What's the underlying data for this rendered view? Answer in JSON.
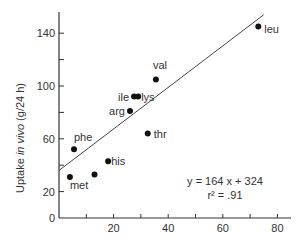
{
  "chart_data": {
    "type": "scatter",
    "title": "",
    "xlabel": "",
    "ylabel": "Uptake in vivo (g/24 h)",
    "ylabel_parts": {
      "pre": "Uptake ",
      "italic": "in vivo",
      "post": " (g/24 h)"
    },
    "xlim": [
      0,
      85
    ],
    "ylim": [
      0,
      155
    ],
    "x_ticks": [
      10,
      20,
      30,
      40,
      50,
      60,
      70,
      80
    ],
    "x_tick_labels": [
      "20",
      "40",
      "60",
      "80"
    ],
    "x_tick_label_values": [
      20,
      40,
      60,
      80
    ],
    "y_ticks": [
      20,
      40,
      60,
      80,
      100,
      120,
      140
    ],
    "y_tick_labels": [
      "0",
      "20",
      "60",
      "100",
      "140"
    ],
    "y_tick_label_values": [
      0,
      20,
      60,
      100,
      140
    ],
    "grid": false,
    "legend": null,
    "series": [
      {
        "name": "amino acids",
        "points": [
          {
            "label": "met",
            "x": 4,
            "y": 31
          },
          {
            "label": "phe",
            "x": 5.5,
            "y": 52
          },
          {
            "label": "",
            "x": 13,
            "y": 33
          },
          {
            "label": "his",
            "x": 18,
            "y": 43
          },
          {
            "label": "arg",
            "x": 26,
            "y": 81
          },
          {
            "label": "ile",
            "x": 27.5,
            "y": 92
          },
          {
            "label": "lys",
            "x": 29,
            "y": 92
          },
          {
            "label": "thr",
            "x": 32.5,
            "y": 64
          },
          {
            "label": "val",
            "x": 35.5,
            "y": 105
          },
          {
            "label": "leu",
            "x": 73,
            "y": 145
          }
        ]
      }
    ],
    "regression_line": {
      "x": [
        0,
        75
      ],
      "y": [
        36,
        154
      ]
    },
    "annotations": {
      "equation": "y = 164 x + 324",
      "r_squared": "r² = .91"
    }
  }
}
